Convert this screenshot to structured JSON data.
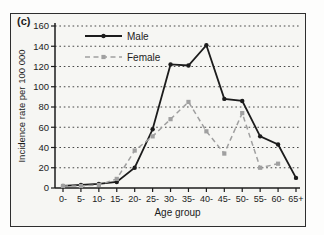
{
  "figure": {
    "panel_label": "(c)",
    "colors": {
      "male": "#1c1c1c",
      "female": "#a0a0a0",
      "grid": "#333333",
      "axis": "#1c1c1c",
      "text": "#1c1c1c",
      "frame": "#2e2e2e",
      "plot_background": "#f6f6f3"
    }
  },
  "chart_data": {
    "type": "line",
    "title": "",
    "xlabel": "Age group",
    "ylabel": "Incidence rate per 100 000",
    "categories": [
      "0-",
      "5-",
      "10-",
      "15-",
      "20-",
      "25-",
      "30-",
      "35-",
      "40-",
      "45-",
      "50-",
      "55-",
      "60-",
      "65+"
    ],
    "ylim": [
      0,
      160
    ],
    "yticks": [
      0,
      20,
      40,
      60,
      80,
      100,
      120,
      140,
      160
    ],
    "grid": "horizontal dotted",
    "legend_position": "top-left inside plot",
    "series": [
      {
        "name": "Male",
        "style": "solid",
        "marker": "circle",
        "color": "#1c1c1c",
        "values": [
          2,
          3,
          4,
          6,
          20,
          58,
          122,
          121,
          141,
          88,
          86,
          51,
          43,
          10
        ]
      },
      {
        "name": "Female",
        "style": "dashed",
        "marker": "square",
        "color": "#a0a0a0",
        "values": [
          2,
          2,
          3,
          9,
          37,
          51,
          68,
          85,
          56,
          34,
          74,
          20,
          24,
          null
        ]
      }
    ]
  }
}
